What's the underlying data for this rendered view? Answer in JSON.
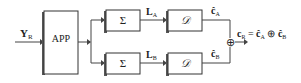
{
  "diagram": {
    "input": {
      "main": "Y",
      "sub": "R"
    },
    "app_block": {
      "label": "APP"
    },
    "sum_block_a": {
      "label": "Σ"
    },
    "sum_block_b": {
      "label": "Σ"
    },
    "decoder_a": {
      "label": "𝒟"
    },
    "decoder_b": {
      "label": "𝒟"
    },
    "signal_la": {
      "main": "L",
      "sub": "A"
    },
    "signal_lb": {
      "main": "L",
      "sub": "B"
    },
    "output_ca": {
      "main": "ĉ",
      "sub": "A"
    },
    "output_cb": {
      "main": "ĉ",
      "sub": "B"
    },
    "xor_symbol": "⊕",
    "result": {
      "lhs_main": "c",
      "lhs_sub": "R",
      "eq": " = ",
      "t1_main": "ĉ",
      "t1_sub": "A",
      "op": " ⊕ ",
      "t2_main": "ĉ",
      "t2_sub": "B"
    }
  }
}
